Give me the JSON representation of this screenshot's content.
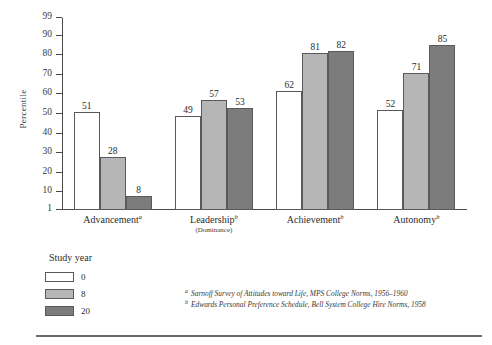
{
  "chart_data": {
    "type": "bar",
    "title": "",
    "xlabel": "",
    "ylabel": "Percentile",
    "ylim": [
      1,
      99
    ],
    "grid": false,
    "legend_position": "below-left",
    "categories": [
      "Advancement",
      "Leadership",
      "Achievement",
      "Autonomy"
    ],
    "category_footnote_marks": [
      "a",
      "b",
      "b",
      "b"
    ],
    "category_sublabels": [
      "",
      "(Dominance)",
      "",
      ""
    ],
    "series": [
      {
        "name": "0",
        "color": "#ffffff",
        "values": [
          51,
          49,
          62,
          52
        ]
      },
      {
        "name": "8",
        "color": "#b6b6b6",
        "values": [
          28,
          57,
          81,
          71
        ]
      },
      {
        "name": "20",
        "color": "#7c7c7c",
        "values": [
          8,
          53,
          82,
          85
        ]
      }
    ],
    "y_ticks": [
      1,
      10,
      20,
      30,
      40,
      50,
      60,
      70,
      80,
      90,
      99
    ]
  },
  "legend": {
    "title": "Study year",
    "items": [
      {
        "label": "0"
      },
      {
        "label": "8"
      },
      {
        "label": "20"
      }
    ]
  },
  "footnotes": [
    {
      "mark": "a",
      "text": "Sarnoff Survey of Attitudes toward Life, MPS College Norms, 1956–1960"
    },
    {
      "mark": "b",
      "text": "Edwards Personal Preference Schedule, Bell System College Hire Norms, 1958"
    }
  ]
}
